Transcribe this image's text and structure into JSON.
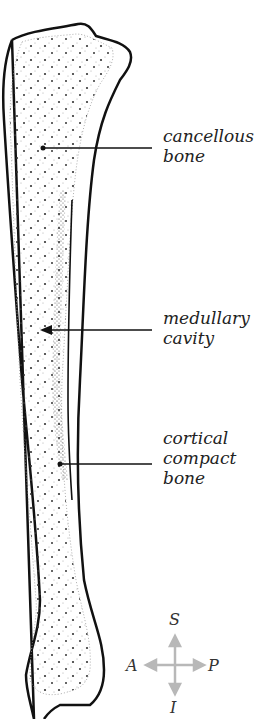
{
  "figure": {
    "labels": [
      {
        "id": "cancellous",
        "lines": [
          "cancellous",
          "bone"
        ]
      },
      {
        "id": "medullary",
        "lines": [
          "medullary",
          "cavity"
        ]
      },
      {
        "id": "cortical",
        "lines": [
          "cortical",
          "compact",
          "bone"
        ]
      }
    ],
    "compass": {
      "superior": "S",
      "inferior": "I",
      "anterior": "A",
      "posterior": "P",
      "arrow_color": "#b8b8b8"
    },
    "colors": {
      "outline": "#111111",
      "stipple": "#333333",
      "background": "#ffffff"
    }
  }
}
